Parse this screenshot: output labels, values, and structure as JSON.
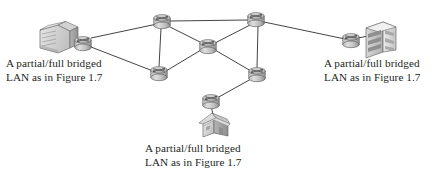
{
  "figure": {
    "background_color": "#ffffff",
    "line_color": "#3a3a3a",
    "device_fill": "#c9c9c9",
    "device_edge": "#5a5a5a"
  },
  "labels": [
    {
      "id": "label-left",
      "line1": "A partial/full bridged",
      "line2": "LAN as in Figure 1.7"
    },
    {
      "id": "label-right",
      "line1": "A partial/full bridged",
      "line2": "LAN as in Figure 1.7"
    },
    {
      "id": "label-bottom",
      "line1": "A partial/full bridged",
      "line2": "LAN as in Figure 1.7"
    }
  ],
  "diagram_data": {
    "type": "network-topology",
    "nodes": [
      {
        "id": "bldg-left",
        "kind": "server-building",
        "label": "",
        "x": 60,
        "y": 40
      },
      {
        "id": "router-left",
        "kind": "router",
        "label": "",
        "x": 83,
        "y": 43
      },
      {
        "id": "router-tl",
        "kind": "router",
        "label": "",
        "x": 162,
        "y": 21
      },
      {
        "id": "router-tr",
        "kind": "router",
        "label": "",
        "x": 256,
        "y": 19
      },
      {
        "id": "router-c",
        "kind": "router",
        "label": "",
        "x": 208,
        "y": 46
      },
      {
        "id": "router-bl",
        "kind": "router",
        "label": "",
        "x": 159,
        "y": 73
      },
      {
        "id": "router-br",
        "kind": "router",
        "label": "",
        "x": 257,
        "y": 74
      },
      {
        "id": "router-bot",
        "kind": "router",
        "label": "",
        "x": 211,
        "y": 100
      },
      {
        "id": "house-bot",
        "kind": "house",
        "label": "",
        "x": 216,
        "y": 125
      },
      {
        "id": "router-right",
        "kind": "router",
        "label": "",
        "x": 351,
        "y": 40
      },
      {
        "id": "bldg-right",
        "kind": "tower-building",
        "label": "",
        "x": 382,
        "y": 37
      }
    ],
    "links": [
      {
        "from": "bldg-left",
        "to": "router-left"
      },
      {
        "from": "router-left",
        "to": "router-tl"
      },
      {
        "from": "router-left",
        "to": "router-bl"
      },
      {
        "from": "router-tl",
        "to": "router-tr"
      },
      {
        "from": "router-tl",
        "to": "router-c"
      },
      {
        "from": "router-tl",
        "to": "router-bl"
      },
      {
        "from": "router-c",
        "to": "router-tr"
      },
      {
        "from": "router-c",
        "to": "router-bl"
      },
      {
        "from": "router-c",
        "to": "router-br"
      },
      {
        "from": "router-tr",
        "to": "router-br"
      },
      {
        "from": "router-tr",
        "to": "router-right"
      },
      {
        "from": "router-br",
        "to": "router-bot"
      },
      {
        "from": "router-bot",
        "to": "house-bot"
      },
      {
        "from": "router-right",
        "to": "bldg-right"
      }
    ]
  }
}
